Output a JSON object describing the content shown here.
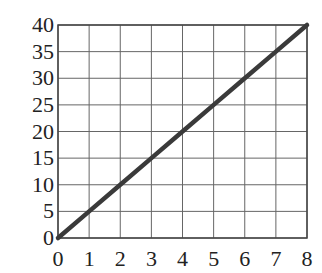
{
  "chart_data": {
    "type": "line",
    "title": "",
    "xlabel": "",
    "ylabel": "",
    "xlim": [
      0,
      8
    ],
    "ylim": [
      0,
      40
    ],
    "grid": true,
    "x_ticks": [
      0,
      1,
      2,
      3,
      4,
      5,
      6,
      7,
      8
    ],
    "y_ticks": [
      0,
      5,
      10,
      15,
      20,
      25,
      30,
      35,
      40
    ],
    "x_tick_labels": [
      "0",
      "1",
      "2",
      "3",
      "4",
      "5",
      "6",
      "7",
      "8"
    ],
    "y_tick_labels": [
      "0",
      "5",
      "10",
      "15",
      "20",
      "25",
      "30",
      "35",
      "40"
    ],
    "series": [
      {
        "name": "line",
        "x": [
          0,
          1,
          2,
          3,
          4,
          5,
          6,
          7,
          8
        ],
        "values": [
          0,
          5,
          10,
          15,
          20,
          25,
          30,
          35,
          40
        ],
        "color": "#3a3a3a"
      }
    ],
    "legend": null
  },
  "layout": {
    "plot_left": 58,
    "plot_top": 25,
    "plot_right": 307,
    "plot_bottom": 238
  }
}
